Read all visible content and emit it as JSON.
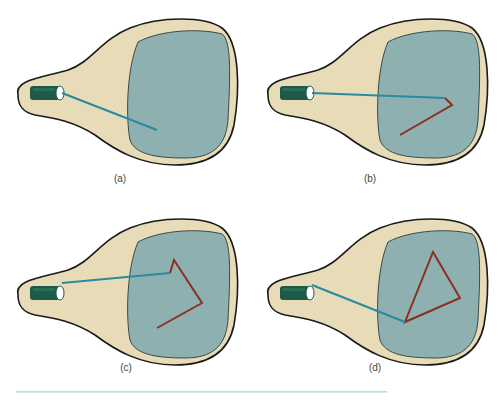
{
  "figure": {
    "colors": {
      "tube_fill": "#e8dcb8",
      "tube_outline": "#1a1a1a",
      "screen_fill": "#8fb0b0",
      "screen_outline": "#3a4a48",
      "gun_body": "#1e5a48",
      "gun_opening": "#ffffff",
      "beam": "#2a8aa0",
      "trace": "#8a3020",
      "rule": "#b8d4dc"
    },
    "panels": [
      {
        "label": "(a)",
        "offset": [
          0,
          0
        ],
        "beam": [
          [
            62,
            93
          ],
          [
            157,
            130
          ]
        ],
        "trace": []
      },
      {
        "label": "(b)",
        "offset": [
          250,
          0
        ],
        "beam": [
          [
            62,
            93
          ],
          [
            195,
            98
          ]
        ],
        "trace": [
          [
            195,
            98
          ],
          [
            202,
            105
          ],
          [
            150,
            135
          ]
        ]
      },
      {
        "label": "(c)",
        "offset": [
          0,
          200
        ],
        "beam": [
          [
            62,
            83
          ],
          [
            170,
            73
          ]
        ],
        "trace": [
          [
            170,
            73
          ],
          [
            174,
            60
          ],
          [
            202,
            103
          ],
          [
            157,
            128
          ]
        ]
      },
      {
        "label": "(d)",
        "offset": [
          250,
          200
        ],
        "beam": [
          [
            62,
            85
          ],
          [
            155,
            122
          ]
        ],
        "trace": [
          [
            155,
            122
          ],
          [
            183,
            52
          ],
          [
            210,
            98
          ],
          [
            155,
            122
          ]
        ]
      }
    ]
  }
}
